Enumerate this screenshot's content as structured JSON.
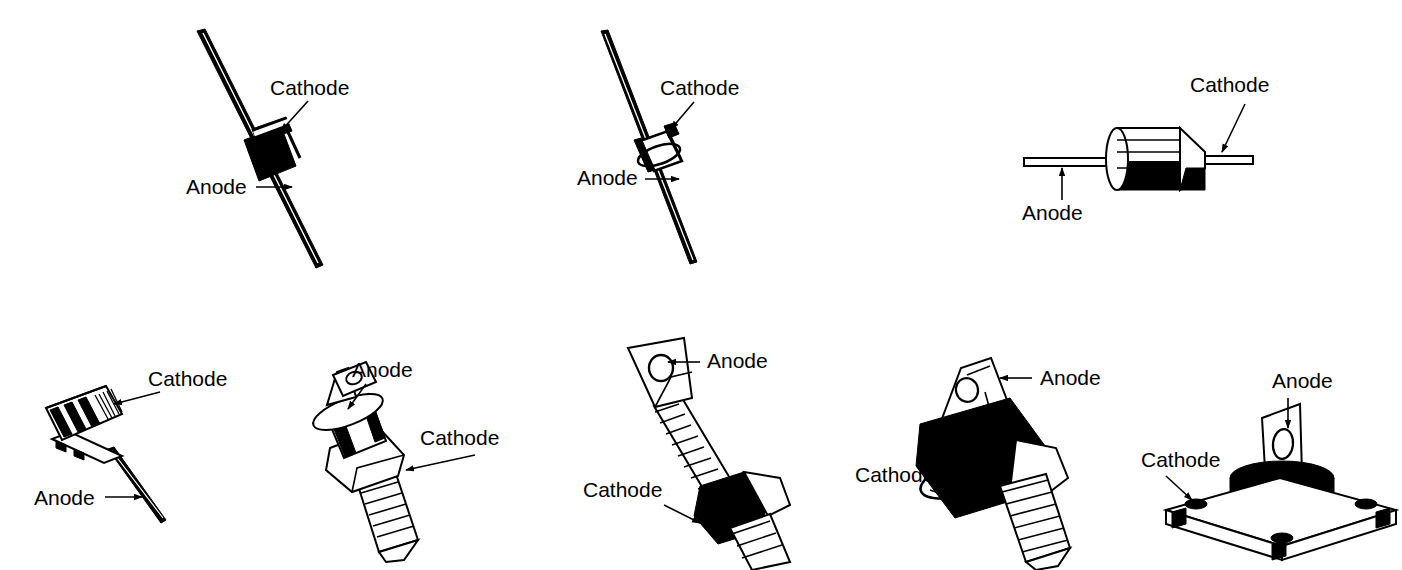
{
  "figure": {
    "background_color": "#ffffff",
    "ink_color": "#000000",
    "label_anode": "Anode",
    "label_cathode": "Cathode"
  },
  "packages": [
    {
      "id": "axial-black-band",
      "name": "Axial leaded diode, tilted, black body with white cathode band",
      "row": 1,
      "column": 1,
      "anode_label": "Anode",
      "cathode_label": "Cathode",
      "anode_text_x": 186,
      "anode_text_y": 194,
      "cathode_text_x": 270,
      "cathode_text_y": 95
    },
    {
      "id": "axial-glass-small",
      "name": "Axial leaded glass diode, tilted, outlined body with cathode band",
      "row": 1,
      "column": 2,
      "anode_label": "Anode",
      "cathode_label": "Cathode",
      "anode_text_x": 577,
      "anode_text_y": 185,
      "cathode_text_x": 660,
      "cathode_text_y": 95
    },
    {
      "id": "axial-horizontal-cone",
      "name": "Horizontal axial diode, cylindrical body with tapered cathode cone",
      "row": 1,
      "column": 3,
      "anode_label": "Anode",
      "cathode_label": "Cathode",
      "anode_text_x": 1022,
      "anode_text_y": 220,
      "cathode_text_x": 1190,
      "cathode_text_y": 92
    },
    {
      "id": "top-hat-wire-lead",
      "name": "Top-hat stud diode with single wire anode lead",
      "row": 2,
      "column": 1,
      "anode_label": "Anode",
      "cathode_label": "Cathode",
      "anode_text_x": 34,
      "anode_text_y": 505,
      "cathode_text_x": 148,
      "cathode_text_y": 386
    },
    {
      "id": "stud-mount-flag-small",
      "name": "Stud mount diode, threaded stud cathode and flag terminal anode",
      "row": 2,
      "column": 2,
      "anode_label": "Anode",
      "cathode_label": "Cathode",
      "anode_text_x": 352,
      "anode_text_y": 377,
      "cathode_text_x": 420,
      "cathode_text_y": 445
    },
    {
      "id": "stud-mount-braided-lead",
      "name": "Stud mount diode with braided flexible lead and ring terminal anode",
      "row": 2,
      "column": 3,
      "anode_label": "Anode",
      "cathode_label": "Cathode",
      "anode_text_x": 707,
      "anode_text_y": 368,
      "cathode_text_x": 583,
      "cathode_text_y": 497
    },
    {
      "id": "stud-mount-power-hex",
      "name": "Power stud mount diode with hex nut and flag terminal anode",
      "row": 2,
      "column": 4,
      "anode_label": "Anode",
      "cathode_label": "Cathode",
      "anode_text_x": 1040,
      "anode_text_y": 385,
      "cathode_text_x": 855,
      "cathode_text_y": 482
    },
    {
      "id": "flat-base-flange-mount",
      "name": "Flat base flange mount diode with four mounting holes and blade anode",
      "row": 2,
      "column": 5,
      "anode_label": "Anode",
      "cathode_label": "Cathode",
      "anode_text_x": 1272,
      "anode_text_y": 388,
      "cathode_text_x": 1141,
      "cathode_text_y": 467
    }
  ]
}
